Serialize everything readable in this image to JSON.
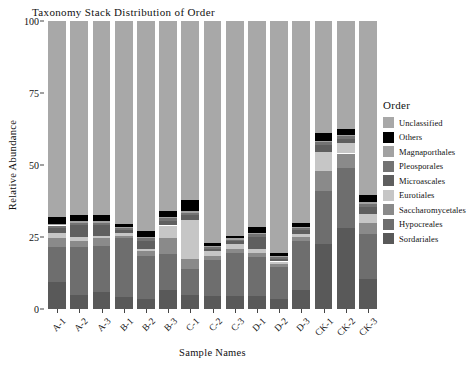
{
  "chart_data": {
    "type": "bar",
    "stacked": true,
    "title": "Taxonomy Stack Distribution of Order",
    "xlabel": "Sample Names",
    "ylabel": "Relative Abundance",
    "legend_title": "Order",
    "legend_position": "right",
    "grid": false,
    "ylim": [
      0,
      100
    ],
    "yticks": [
      "0",
      "25",
      "50",
      "75",
      "100"
    ],
    "ytick_values": [
      0,
      25,
      50,
      75,
      100
    ],
    "categories": [
      "A-1",
      "A-2",
      "A-3",
      "B-1",
      "B-2",
      "B-3",
      "C-1",
      "C-2",
      "C-3",
      "D-1",
      "D-2",
      "D-3",
      "CK-1",
      "CK-2",
      "CK-3"
    ],
    "series": [
      {
        "name": "Sordariales",
        "color": "#595959",
        "values": [
          9.5,
          5.0,
          6.0,
          4.0,
          3.5,
          6.5,
          5.0,
          4.5,
          4.5,
          4.5,
          3.5,
          6.5,
          22.5,
          28.0,
          10.5
        ]
      },
      {
        "name": "Hypocreales",
        "color": "#6e6e6e",
        "values": [
          12.0,
          16.5,
          16.0,
          20.5,
          15.0,
          12.5,
          9.0,
          12.5,
          15.0,
          13.5,
          11.0,
          17.0,
          18.5,
          21.0,
          15.5
        ]
      },
      {
        "name": "Saccharomycetales",
        "color": "#8a8a8a",
        "values": [
          3.0,
          2.0,
          2.5,
          1.0,
          1.5,
          5.5,
          3.5,
          1.5,
          1.5,
          1.5,
          1.0,
          1.5,
          7.0,
          5.0,
          4.0
        ]
      },
      {
        "name": "Eurotiales",
        "color": "#c6c6c6",
        "values": [
          2.0,
          1.5,
          1.0,
          1.0,
          1.0,
          4.5,
          13.5,
          1.5,
          1.5,
          1.5,
          1.0,
          1.0,
          6.5,
          3.5,
          3.0
        ]
      },
      {
        "name": "Microascales",
        "color": "#5f5f5f",
        "values": [
          1.5,
          4.0,
          3.5,
          1.0,
          2.5,
          1.5,
          1.5,
          1.0,
          1.0,
          4.0,
          1.0,
          1.5,
          2.5,
          1.5,
          2.5
        ]
      },
      {
        "name": "Pleosporales",
        "color": "#737373",
        "values": [
          1.0,
          1.0,
          1.0,
          0.5,
          1.0,
          1.0,
          1.0,
          0.5,
          0.5,
          1.0,
          0.5,
          0.5,
          1.0,
          1.0,
          1.0
        ]
      },
      {
        "name": "Magnaporthales",
        "color": "#a2a2a2",
        "values": [
          0.5,
          0.5,
          0.5,
          0.5,
          0.5,
          0.5,
          0.5,
          0.5,
          0.5,
          0.5,
          0.5,
          0.5,
          0.5,
          0.5,
          0.5
        ]
      },
      {
        "name": "Others",
        "color": "#000000",
        "values": [
          2.5,
          2.0,
          2.0,
          1.0,
          2.0,
          2.0,
          4.0,
          1.0,
          1.0,
          2.0,
          1.0,
          1.5,
          2.5,
          2.0,
          2.5
        ]
      },
      {
        "name": "Unclassified",
        "color": "#a8a8a8",
        "values": [
          68.0,
          67.5,
          67.5,
          70.5,
          73.0,
          66.0,
          62.0,
          77.0,
          74.5,
          71.5,
          80.5,
          70.0,
          39.0,
          37.5,
          60.5
        ]
      }
    ]
  },
  "legend": {
    "title": "Order",
    "items": [
      {
        "label": "Unclassified",
        "color": "#a8a8a8"
      },
      {
        "label": "Others",
        "color": "#000000"
      },
      {
        "label": "Magnaporthales",
        "color": "#a2a2a2"
      },
      {
        "label": "Pleosporales",
        "color": "#737373"
      },
      {
        "label": "Microascales",
        "color": "#5f5f5f"
      },
      {
        "label": "Eurotiales",
        "color": "#c6c6c6"
      },
      {
        "label": "Saccharomycetales",
        "color": "#8a8a8a"
      },
      {
        "label": "Hypocreales",
        "color": "#6e6e6e"
      },
      {
        "label": "Sordariales",
        "color": "#595959"
      }
    ]
  }
}
